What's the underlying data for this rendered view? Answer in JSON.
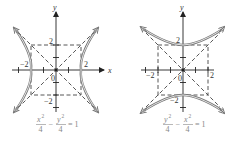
{
  "figures": [
    {
      "id": "left",
      "description": "Hyperbola opening left-right with asymptotes and guide box",
      "axis_labels": {
        "x": "x",
        "y": "y"
      },
      "tick_labels": {
        "x_pos": "2",
        "x_neg": "−2",
        "y_pos": "2",
        "y_neg": "−2",
        "origin": "0"
      },
      "equation": {
        "term1_num": "x",
        "term1_exp": "2",
        "term1_den": "4",
        "minus": "−",
        "term2_num": "y",
        "term2_exp": "2",
        "term2_den": "4",
        "rhs": "= 1"
      }
    },
    {
      "id": "right",
      "description": "Hyperbola opening up-down with asymptotes and guide box",
      "axis_labels": {
        "y": "y"
      },
      "tick_labels": {
        "x_pos": "2",
        "x_neg": "−2",
        "y_pos": "2",
        "y_neg": "−2",
        "origin": "0"
      },
      "equation": {
        "term1_num": "y",
        "term1_exp": "2",
        "term1_den": "4",
        "minus": "−",
        "term2_num": "x",
        "term2_exp": "2",
        "term2_den": "4",
        "rhs": "= 1"
      }
    }
  ],
  "colors": {
    "axis": "#222222",
    "curve": "#777777",
    "curve_inner": "#ffffff",
    "dashed": "#444444",
    "equation": "#888888"
  }
}
